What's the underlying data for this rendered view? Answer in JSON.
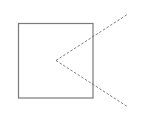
{
  "diagram": {
    "background": "#ffffff",
    "square": {
      "x": 18.5,
      "y": 23.5,
      "width": 74.5,
      "height": 74.5,
      "stroke": "#7a7a7a",
      "stroke_width": 1.2
    },
    "angle": {
      "vertex": {
        "x": 56,
        "y": 60.5
      },
      "ray_upper_end": {
        "x": 128,
        "y": 14
      },
      "ray_lower_end": {
        "x": 128,
        "y": 107
      },
      "stroke": "#6e6e6e",
      "stroke_width": 0.9,
      "dash": "2.5,1.8"
    }
  }
}
